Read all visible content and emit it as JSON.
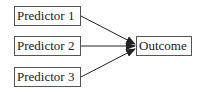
{
  "diagram": {
    "nodes": [
      {
        "id": "p1",
        "label": "Predictor 1"
      },
      {
        "id": "p2",
        "label": "Predictor 2"
      },
      {
        "id": "p3",
        "label": "Predictor 3"
      },
      {
        "id": "outcome",
        "label": "Outcome"
      }
    ],
    "edges": [
      {
        "from": "p1",
        "to": "outcome"
      },
      {
        "from": "p2",
        "to": "outcome"
      },
      {
        "from": "p3",
        "to": "outcome"
      }
    ],
    "colors": {
      "line": "#222222",
      "border": "#555555"
    }
  }
}
